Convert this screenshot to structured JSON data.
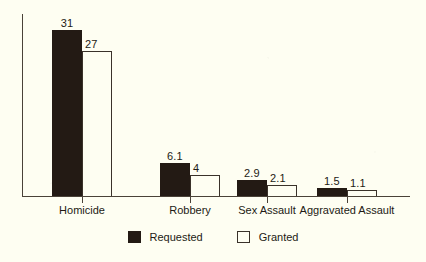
{
  "chart_data": {
    "type": "bar",
    "title": "",
    "subtitle": "",
    "xlabel": "",
    "ylabel": "",
    "grid": false,
    "legend_position": "bottom-center",
    "ylim": [
      0,
      34
    ],
    "axis_visible": {
      "y_axis": true,
      "x_axis": true,
      "y_ticks": false,
      "x_ticks": true
    },
    "categories": [
      "Homicide",
      "Robbery",
      "Sex Assault",
      "Aggravated Assault"
    ],
    "series": [
      {
        "name": "Requested",
        "style": "filled",
        "color": "#231a14",
        "values": [
          31,
          6.1,
          2.9,
          1.5
        ],
        "labels": [
          "31",
          "6.1",
          "2.9",
          "1.5"
        ]
      },
      {
        "name": "Granted",
        "style": "outline",
        "color": "#fefef2",
        "border_color": "#3a322a",
        "values": [
          27,
          4,
          2.1,
          1.1
        ],
        "labels": [
          "27",
          "4",
          "2.1",
          "1.1"
        ]
      }
    ]
  },
  "legend": {
    "items": [
      {
        "label": "Requested",
        "swatch": "filled-square-icon"
      },
      {
        "label": "Granted",
        "swatch": "outline-square-icon"
      }
    ]
  },
  "colors": {
    "background": "#fefef2",
    "ink": "#231a14",
    "axis": "#4a4238",
    "outline": "#3a322a"
  }
}
